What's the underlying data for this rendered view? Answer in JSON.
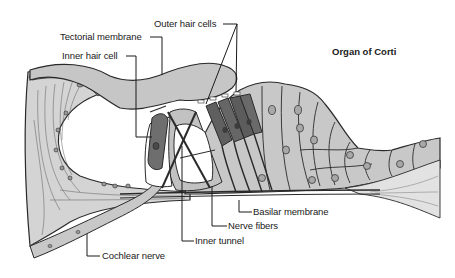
{
  "diagram": {
    "title": "Organ of Corti",
    "colors": {
      "background": "#ffffff",
      "tissue_fill": "#c9c9c9",
      "tissue_light": "#d9d9d9",
      "hair_cell_fill": "#6e6e6e",
      "outline": "#2a2a2a",
      "label_text": "#1a1a1a"
    },
    "labels": [
      {
        "id": "outer-hair-cells",
        "text": "Outer hair cells"
      },
      {
        "id": "tectorial-membrane",
        "text": "Tectorial membrane"
      },
      {
        "id": "inner-hair-cell",
        "text": "Inner hair cell"
      },
      {
        "id": "basilar-membrane",
        "text": "Basilar membrane"
      },
      {
        "id": "nerve-fibers",
        "text": "Nerve fibers"
      },
      {
        "id": "inner-tunnel",
        "text": "Inner tunnel"
      },
      {
        "id": "cochlear-nerve",
        "text": "Cochlear nerve"
      }
    ]
  }
}
